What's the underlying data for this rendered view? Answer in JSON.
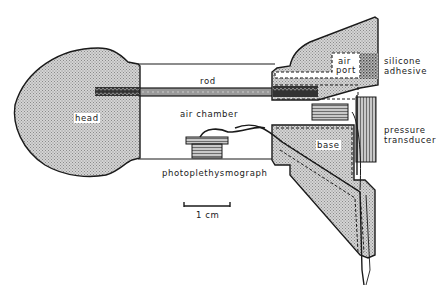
{
  "figure": {
    "labels": {
      "head": "head",
      "rod": "rod",
      "air_chamber": "air chamber",
      "photoplethysmograph": "photoplethysmograph",
      "air_port_line1": "air",
      "air_port_line2": "port",
      "silicone_line1": "silicone",
      "silicone_line2": "adhesive",
      "pressure_line1": "pressure",
      "pressure_line2": "transducer",
      "base": "base",
      "scale": "1 cm"
    },
    "colors": {
      "ink": "#1a1a1a",
      "stipple": "#b8b8b8",
      "rod": "#9a9a9a",
      "background": "#ffffff"
    }
  }
}
